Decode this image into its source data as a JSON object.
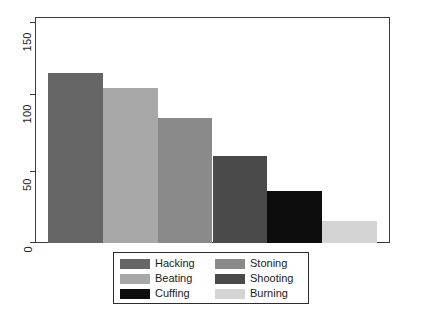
{
  "chart_data": {
    "type": "bar",
    "title": "",
    "subtitle": "",
    "xlabel": "",
    "ylabel": "",
    "categories": [
      "Hacking",
      "Beating",
      "Stoning",
      "Shooting",
      "Cuffing",
      "Burning"
    ],
    "values": [
      117,
      107,
      86,
      60,
      36,
      15
    ],
    "series": [
      {
        "name": "Method",
        "values": [
          117,
          107,
          86,
          60,
          36,
          15
        ]
      }
    ],
    "bar_colors": [
      "#666666",
      "#a8a8a8",
      "#8a8a8a",
      "#4a4a4a",
      "#0d0d0d",
      "#d4d4d4"
    ],
    "ylim": [
      0,
      155
    ],
    "yticks": [
      0,
      50,
      100,
      150
    ],
    "ytick_labels": [
      "0",
      "50",
      "100",
      "150"
    ],
    "xticks": [],
    "xtick_labels": [],
    "grid": false,
    "legend_position": "bottom-center",
    "legend": [
      {
        "label": "Hacking",
        "color": "#666666"
      },
      {
        "label": "Stoning",
        "color": "#8a8a8a"
      },
      {
        "label": "Beating",
        "color": "#a8a8a8"
      },
      {
        "label": "Shooting",
        "color": "#4a4a4a"
      },
      {
        "label": "Cuffing",
        "color": "#0d0d0d"
      },
      {
        "label": "Burning",
        "color": "#d4d4d4"
      }
    ],
    "axis_color": "#3b3b3b",
    "background": "#ffffff"
  }
}
